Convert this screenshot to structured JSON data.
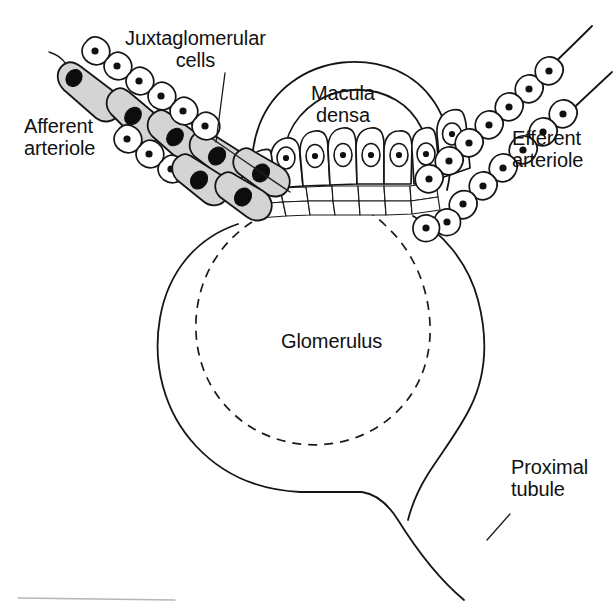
{
  "figure": {
    "background_color": "#ffffff",
    "line_color": "#151515",
    "shaded_cell_color": "#d4d4d4",
    "unshaded_cell_color": "#ffffff",
    "nucleus_color": "#101010"
  },
  "labels": {
    "juxtaglomerular_cells": "Juxtaglomerular\ncells",
    "afferent_arteriole": "Afferent\narteriole",
    "macula_densa": "Macula\ndensa",
    "efferent_arteriole": "Efferent\narteriole",
    "glomerulus": "Glomerulus",
    "proximal_tubule": "Proximal\ntubule"
  },
  "structures": [
    {
      "name": "afferent-arteriole",
      "label": "Afferent arteriole",
      "position": "upper-left",
      "wall_cells": "granular juxtaglomerular cells, shaded gray, with large dark oval nuclei",
      "lining_cells": "small unshaded endothelial cells with round dark nuclei",
      "shaded": true
    },
    {
      "name": "juxtaglomerular-cells",
      "label": "Juxtaglomerular cells",
      "position": "along afferent arteriole wall",
      "wall_cells": "enlarged granular myoepithelial cells",
      "shaded": true,
      "has_leader_line": true
    },
    {
      "name": "macula-densa",
      "label": "Macula densa",
      "position": "top-center",
      "wall_cells": "tall columnar cells with oval nuclei, packed closely together",
      "shaded": false,
      "columnar_cell_count": 7
    },
    {
      "name": "mesangial-cells",
      "label": "",
      "position": "beneath macula densa",
      "wall_cells": "grid of small extraglomerular mesangial cells (lacis cells)",
      "shaded": false,
      "rows": 2
    },
    {
      "name": "efferent-arteriole",
      "label": "Efferent arteriole",
      "position": "upper-right",
      "wall_cells": "small unshaded cells with round dark nuclei",
      "shaded": false
    },
    {
      "name": "glomerulus",
      "label": "Glomerulus",
      "position": "center",
      "outline": "solid Bowman's capsule with dashed inner glomerular tuft boundary",
      "shaded": false
    },
    {
      "name": "proximal-tubule",
      "label": "Proximal tubule",
      "position": "lower-right",
      "outline": "solid tube descending from Bowman's capsule",
      "shaded": false
    }
  ],
  "leader_lines": [
    {
      "from": "Juxtaglomerular cells label",
      "to": "shaded granular cell on afferent arteriole wall"
    },
    {
      "from": "Proximal tubule label",
      "to": "tubule wall"
    }
  ]
}
